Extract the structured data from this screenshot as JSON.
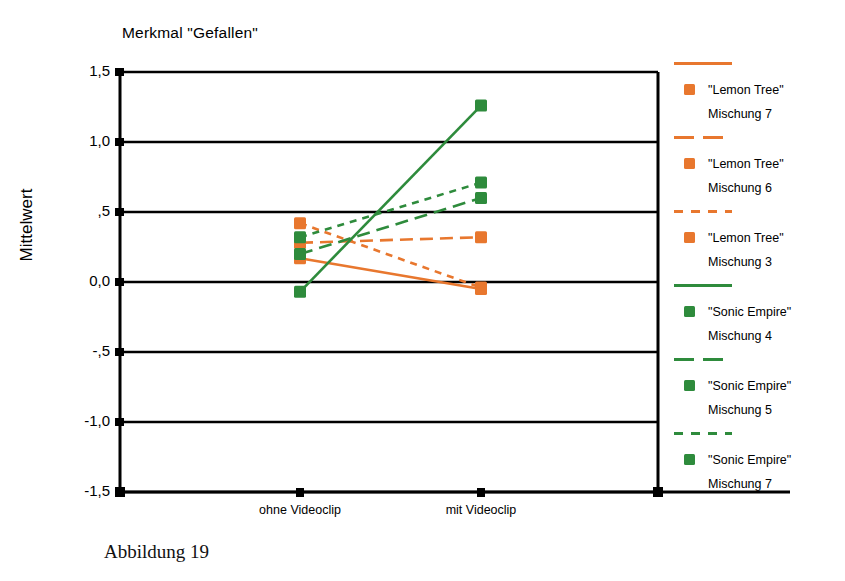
{
  "figure": {
    "caption": "Abbildung 19"
  },
  "chart_data": {
    "type": "line",
    "title": "Merkmal \"Gefallen\"",
    "xlabel": "",
    "ylabel": "Mittelwert",
    "categories": [
      "ohne Videoclip",
      "mit Videoclip"
    ],
    "ylim": [
      -1.5,
      1.5
    ],
    "yticks": [
      "1,5",
      "1,0",
      ",5",
      "0,0",
      "-,5",
      "-1,0",
      "-1,5"
    ],
    "ytick_values": [
      1.5,
      1.0,
      0.5,
      0.0,
      -0.5,
      -1.0,
      -1.5
    ],
    "grid": true,
    "legend_position": "right",
    "colors": {
      "orange": "#E8772E",
      "green": "#2E8B3C",
      "axis": "#000000"
    },
    "series": [
      {
        "name": "\"Lemon Tree\" Mischung 7",
        "label_line1": "\"Lemon Tree\"",
        "label_line2": "Mischung 7",
        "color": "#E8772E",
        "dash": "solid",
        "values": [
          0.17,
          -0.05
        ]
      },
      {
        "name": "\"Lemon Tree\" Mischung 6",
        "label_line1": "\"Lemon Tree\"",
        "label_line2": "Mischung 6",
        "color": "#E8772E",
        "dash": "long-dash",
        "values": [
          0.28,
          0.32
        ]
      },
      {
        "name": "\"Lemon Tree\" Mischung 3",
        "label_line1": "\"Lemon Tree\"",
        "label_line2": "Mischung 3",
        "color": "#E8772E",
        "dash": "short-dash",
        "values": [
          0.42,
          -0.04
        ]
      },
      {
        "name": "\"Sonic Empire\" Mischung 4",
        "label_line1": "\"Sonic Empire\"",
        "label_line2": "Mischung 4",
        "color": "#2E8B3C",
        "dash": "solid",
        "values": [
          -0.07,
          1.26
        ]
      },
      {
        "name": "\"Sonic Empire\" Mischung 5",
        "label_line1": "\"Sonic Empire\"",
        "label_line2": "Mischung 5",
        "color": "#2E8B3C",
        "dash": "long-dash",
        "values": [
          0.2,
          0.6
        ]
      },
      {
        "name": "\"Sonic Empire\" Mischung 7",
        "label_line1": "\"Sonic Empire\"",
        "label_line2": "Mischung 7",
        "color": "#2E8B3C",
        "dash": "short-dash",
        "values": [
          0.32,
          0.71
        ]
      }
    ]
  }
}
